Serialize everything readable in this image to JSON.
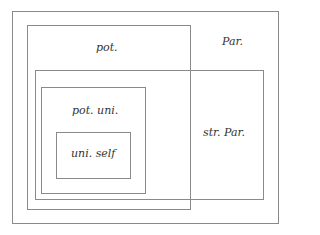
{
  "diagram": {
    "type": "nested-set-diagram",
    "sets": [
      {
        "id": "par",
        "label": "Par.",
        "rect": [
          12,
          11,
          266,
          213
        ]
      },
      {
        "id": "pot",
        "label": "pot.",
        "rect": [
          27,
          25,
          163,
          184
        ]
      },
      {
        "id": "str_par",
        "label": "str. Par.",
        "rect": [
          35,
          70,
          228,
          130
        ]
      },
      {
        "id": "pot_uni",
        "label": "pot. uni.",
        "rect": [
          41,
          87,
          104,
          106
        ]
      },
      {
        "id": "uni_self",
        "label": "uni. self",
        "rect": [
          56,
          132,
          74,
          46
        ]
      }
    ],
    "line_color": "#8a8a8a",
    "text_color": "#333333"
  }
}
